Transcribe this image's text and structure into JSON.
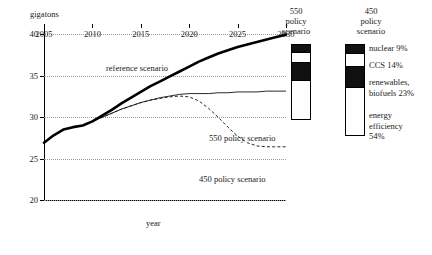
{
  "chart_data": {
    "type": "line",
    "title": "",
    "xlabel": "year",
    "ylabel": "gigatons",
    "xlim": [
      2005,
      2030
    ],
    "ylim": [
      20,
      41.5
    ],
    "grid": true,
    "legend_position": "inline-labels",
    "x_ticks": [
      "2005",
      "2010",
      "2015",
      "2020",
      "2025",
      "2030"
    ],
    "y_ticks": [
      "20",
      "25",
      "30",
      "35",
      "40"
    ],
    "x": [
      2005,
      2006,
      2007,
      2008,
      2009,
      2010,
      2011,
      2012,
      2013,
      2014,
      2015,
      2016,
      2017,
      2018,
      2019,
      2020,
      2021,
      2022,
      2023,
      2024,
      2025,
      2026,
      2027,
      2028,
      2029,
      2030
    ],
    "series": [
      {
        "name": "reference scenario",
        "style": "thick-solid",
        "values": [
          27.0,
          27.9,
          28.6,
          28.9,
          29.1,
          29.6,
          30.3,
          31.0,
          31.8,
          32.5,
          33.2,
          33.9,
          34.5,
          35.1,
          35.7,
          36.3,
          36.9,
          37.4,
          37.9,
          38.3,
          38.7,
          39.0,
          39.3,
          39.6,
          39.9,
          40.2
        ]
      },
      {
        "name": "550 policy scenario",
        "style": "thin-solid",
        "values": [
          27.0,
          27.9,
          28.6,
          28.9,
          29.1,
          29.6,
          30.1,
          30.6,
          31.1,
          31.5,
          31.9,
          32.2,
          32.5,
          32.7,
          32.9,
          33.0,
          33.0,
          33.0,
          33.1,
          33.1,
          33.2,
          33.2,
          33.2,
          33.3,
          33.3,
          33.3
        ]
      },
      {
        "name": "450 policy scenario",
        "style": "dashed",
        "values": [
          27.0,
          27.9,
          28.6,
          28.9,
          29.1,
          29.6,
          30.1,
          30.6,
          31.1,
          31.5,
          31.9,
          32.2,
          32.4,
          32.6,
          32.7,
          32.6,
          32.1,
          31.2,
          30.1,
          28.9,
          27.8,
          27.0,
          26.6,
          26.5,
          26.5,
          26.5
        ]
      }
    ],
    "bars": [
      {
        "name": "550 policy scenario",
        "header_lines": [
          "550",
          "policy",
          "scenario"
        ],
        "segments": [
          {
            "label": "nuclear",
            "value": 9,
            "fill": "dark"
          },
          {
            "label": "CCS",
            "value": 14,
            "fill": "light"
          },
          {
            "label": "renewables, biofuels",
            "value": 23,
            "fill": "dark"
          },
          {
            "label": "energy efficiency",
            "value": 54,
            "fill": "light"
          }
        ]
      },
      {
        "name": "450 policy scenario",
        "header_lines": [
          "450",
          "policy",
          "scenario"
        ],
        "segments": [
          {
            "label": "nuclear",
            "value": 9,
            "fill": "dark"
          },
          {
            "label": "CCS",
            "value": 14,
            "fill": "light"
          },
          {
            "label": "renewables, biofuels",
            "value": 23,
            "fill": "dark"
          },
          {
            "label": "energy efficiency",
            "value": 54,
            "fill": "light"
          }
        ]
      }
    ],
    "annotations": [
      {
        "text": "reference scenario"
      },
      {
        "text": "550 policy scenario"
      },
      {
        "text": "450 policy scenario"
      }
    ]
  },
  "axes": {
    "y_title": "gigatons",
    "x_title": "year",
    "y_ticks": [
      "40",
      "35",
      "30",
      "25",
      "20"
    ],
    "x_ticks": [
      "2005",
      "2010",
      "2015",
      "2020",
      "2025",
      "2030"
    ]
  },
  "curve_labels": {
    "reference": "reference scenario",
    "p550": "550 policy scenario",
    "p450": "450 policy scenario"
  },
  "bar550": {
    "line1": "550",
    "line2": "policy",
    "line3": "scenario"
  },
  "bar450": {
    "line1": "450",
    "line2": "policy",
    "line3": "scenario"
  },
  "legend": {
    "nuclear": "nuclear 9%",
    "ccs": "CCS 14%",
    "renewables_line1": "renewables,",
    "renewables_line2": "biofuels 23%",
    "efficiency_line1": "energy",
    "efficiency_line2": "efficiency",
    "efficiency_line3": "54%"
  },
  "colors": {
    "ink": "#111111",
    "grid": "#9a9a9a",
    "background": "#ffffff"
  }
}
